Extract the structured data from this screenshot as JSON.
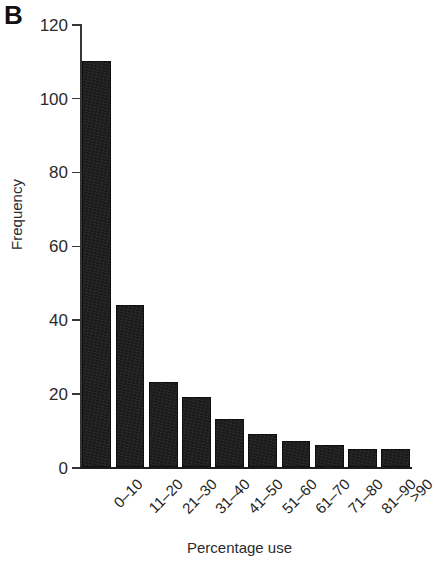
{
  "figure": {
    "panel_label": "B",
    "background_color": "#ffffff",
    "bar_color": "#1b1b1b",
    "axis_color": "#35353a"
  },
  "chart_data": {
    "type": "bar",
    "title": "",
    "xlabel": "Percentage use",
    "ylabel": "Frequency",
    "categories": [
      "0–10",
      "11–20",
      "21–30",
      "31–40",
      "41–50",
      "51–60",
      "61–70",
      "71–80",
      "81–90",
      ">90"
    ],
    "values": [
      110,
      44,
      23,
      19,
      13,
      9,
      7,
      6,
      5,
      5
    ],
    "ylim": [
      0,
      120
    ],
    "yticks": [
      0,
      20,
      40,
      60,
      80,
      100,
      120
    ],
    "ytick_labels": [
      "0",
      "20",
      "40",
      "60",
      "80",
      "100",
      "120"
    ],
    "grid": false,
    "legend": null,
    "series": [
      {
        "name": "Frequency",
        "values": [
          110,
          44,
          23,
          19,
          13,
          9,
          7,
          6,
          5,
          5
        ]
      }
    ]
  }
}
